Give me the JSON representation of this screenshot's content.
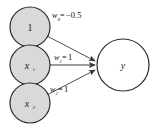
{
  "diagram": {
    "background_color": "#ffffff",
    "node_fill": "#d9d9d9",
    "node_stroke": "#2b2b2b",
    "output_fill": "#ffffff",
    "edge_color": "#3a3a3a",
    "text_color": "#1a1a1a",
    "nodes": [
      {
        "id": "bias",
        "label": "1",
        "subscript": "",
        "italic": false,
        "cx": 30,
        "cy": 27,
        "r": 20,
        "fill": "#d9d9d9"
      },
      {
        "id": "x1",
        "label": "x",
        "subscript": "1",
        "italic": true,
        "cx": 30,
        "cy": 65,
        "r": 20,
        "fill": "#d9d9d9"
      },
      {
        "id": "x2",
        "label": "x",
        "subscript": "2",
        "italic": true,
        "cx": 30,
        "cy": 103,
        "r": 20,
        "fill": "#d9d9d9"
      },
      {
        "id": "y",
        "label": "y",
        "subscript": "",
        "italic": true,
        "cx": 123,
        "cy": 65,
        "r": 26,
        "fill": "#ffffff"
      }
    ],
    "edges": [
      {
        "id": "edge-bias-y",
        "from": "bias",
        "to": "y",
        "weight_symbol": "w",
        "weight_subscript": "0",
        "weight_value": "−0.5",
        "label_text": "w0=−0.5",
        "label_x": 52,
        "label_y": 18
      },
      {
        "id": "edge-x1-y",
        "from": "x1",
        "to": "y",
        "weight_symbol": "w",
        "weight_subscript": "1",
        "weight_value": "1",
        "label_text": "w1=1",
        "label_x": 54,
        "label_y": 60
      },
      {
        "id": "edge-x2-y",
        "from": "x2",
        "to": "y",
        "weight_symbol": "w",
        "weight_subscript": "2",
        "weight_value": "1",
        "label_text": "w2=1",
        "label_x": 50,
        "label_y": 92
      }
    ]
  }
}
